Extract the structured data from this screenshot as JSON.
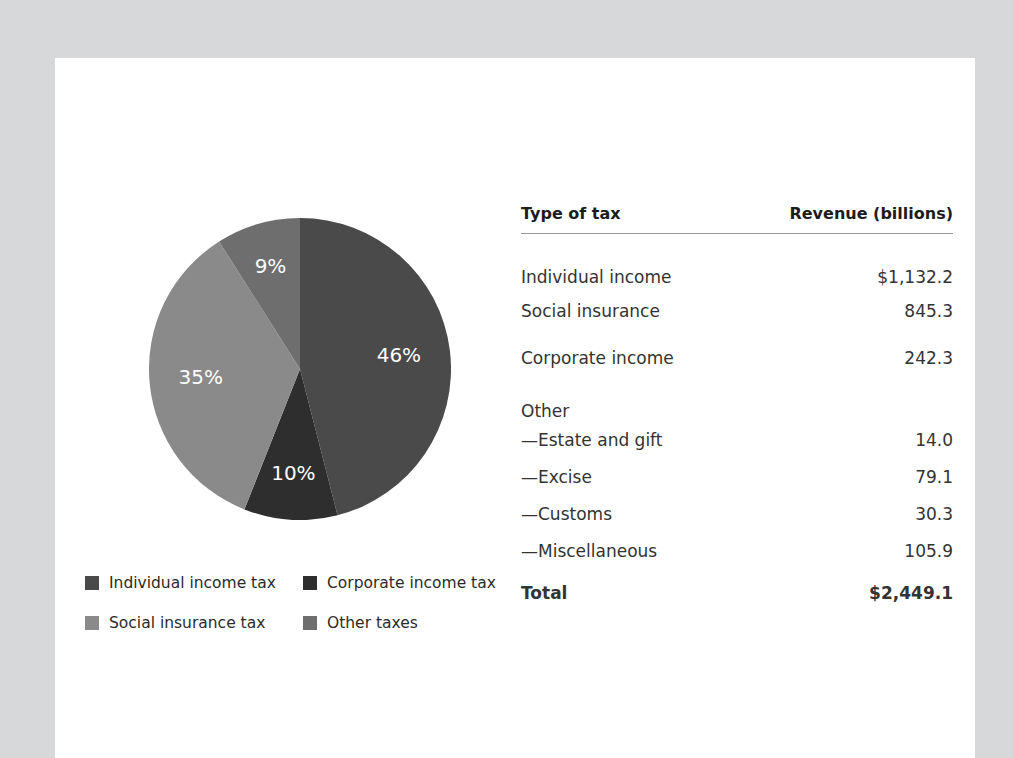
{
  "figure": {
    "card_background": "#ffffff",
    "page_background": "#d7d8d9"
  },
  "chart_data": {
    "type": "pie",
    "title": "",
    "categories": [
      "Individual income tax",
      "Corporate income tax",
      "Social insurance tax",
      "Other taxes"
    ],
    "values": [
      46,
      10,
      35,
      9
    ],
    "value_labels": [
      "46%",
      "10%",
      "35%",
      "9%"
    ],
    "colors": [
      "#4a4a4a",
      "#2e2e2e",
      "#8a8a8a",
      "#6e6e6e"
    ],
    "units": "percent",
    "legend_position": "bottom-left",
    "start_angle_deg": 0,
    "direction": "clockwise",
    "slices": [
      {
        "label": "Individual income tax",
        "percent": 46,
        "display": "46%",
        "color": "#4a4a4a",
        "revenue_billions": 1132.2
      },
      {
        "label": "Corporate income tax",
        "percent": 10,
        "display": "10%",
        "color": "#2e2e2e",
        "revenue_billions": 242.3
      },
      {
        "label": "Social insurance tax",
        "percent": 35,
        "display": "35%",
        "color": "#8a8a8a",
        "revenue_billions": 845.3
      },
      {
        "label": "Other taxes",
        "percent": 9,
        "display": "9%",
        "color": "#6e6e6e",
        "revenue_billions": 229.3
      }
    ]
  },
  "legend": {
    "items": [
      {
        "label": "Individual income tax",
        "color": "#4a4a4a"
      },
      {
        "label": "Corporate income tax",
        "color": "#2e2e2e"
      },
      {
        "label": "Social insurance tax",
        "color": "#8a8a8a"
      },
      {
        "label": "Other taxes",
        "color": "#6e6e6e"
      }
    ]
  },
  "table": {
    "headers": {
      "type_of_tax": "Type of tax",
      "revenue": "Revenue (billions)"
    },
    "rows": [
      {
        "label": "Individual income",
        "value": "$1,132.2",
        "kind": "main"
      },
      {
        "label": "Social insurance",
        "value": "845.3",
        "kind": "main"
      },
      {
        "label": "Corporate income",
        "value": "242.3",
        "kind": "main"
      },
      {
        "label": "Other",
        "value": "",
        "kind": "group"
      },
      {
        "label": "—Estate and gift",
        "value": "14.0",
        "kind": "sub"
      },
      {
        "label": "—Excise",
        "value": "79.1",
        "kind": "sub"
      },
      {
        "label": "—Customs",
        "value": "30.3",
        "kind": "sub"
      },
      {
        "label": "—Miscellaneous",
        "value": "105.9",
        "kind": "sub"
      }
    ],
    "total": {
      "label": "Total",
      "value": "$2,449.1"
    }
  }
}
